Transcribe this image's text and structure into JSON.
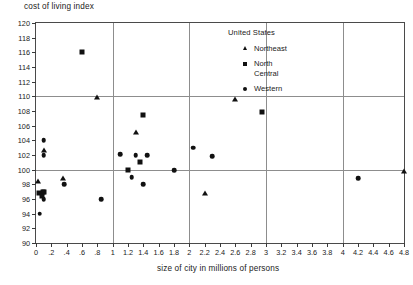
{
  "chart_data": {
    "type": "scatter",
    "title": "",
    "ylabel": "cost of living index",
    "xlabel": "size of city in millions of persons",
    "xlim": [
      0,
      4.8
    ],
    "ylim": [
      90,
      120
    ],
    "y_ticks": [
      90,
      92,
      94,
      96,
      98,
      100,
      102,
      104,
      106,
      108,
      110,
      112,
      114,
      116,
      118,
      120
    ],
    "x_ticks": [
      0,
      0.2,
      0.4,
      0.6,
      0.8,
      1.0,
      1.2,
      1.4,
      1.6,
      1.8,
      2.0,
      2.2,
      2.4,
      2.6,
      2.8,
      3.0,
      3.2,
      3.4,
      3.6,
      3.8,
      4.0,
      4.2,
      4.4,
      4.6,
      4.8
    ],
    "x_tick_labels": [
      "0",
      ".2",
      ".4",
      ".6",
      ".8",
      "1",
      "1.2",
      "1.4",
      "1.6",
      "1.8",
      "2",
      "2.2",
      "2.4",
      "2.6",
      "2.8",
      "3",
      "3.2",
      "3.4",
      "3.6",
      "3.8",
      "4",
      "4.2",
      "4.4",
      "4.6",
      "4.8"
    ],
    "gridlines_vertical": [
      1,
      2,
      3,
      4
    ],
    "gridlines_horizontal": [
      100,
      110
    ],
    "grid": true,
    "legend_position": "inside-top-right",
    "legend_title": "United States",
    "series": [
      {
        "name": "Northeast",
        "marker": "triangle",
        "color": "#111111",
        "points": [
          [
            0.02,
            98.6
          ],
          [
            0.1,
            102.8
          ],
          [
            0.35,
            99.0
          ],
          [
            0.8,
            110.0
          ],
          [
            1.3,
            105.3
          ],
          [
            2.2,
            97.0
          ],
          [
            2.6,
            109.8
          ],
          [
            4.8,
            100.0
          ]
        ]
      },
      {
        "name": "North\nCentral",
        "marker": "square",
        "color": "#111111",
        "points": [
          [
            0.04,
            96.8
          ],
          [
            0.09,
            96.9
          ],
          [
            0.11,
            97.0
          ],
          [
            0.08,
            96.4
          ],
          [
            0.6,
            116.0
          ],
          [
            1.2,
            100.0
          ],
          [
            1.35,
            101.0
          ],
          [
            1.4,
            107.5
          ],
          [
            2.95,
            107.8
          ]
        ]
      },
      {
        "name": "Western",
        "marker": "circle",
        "color": "#111111",
        "points": [
          [
            0.05,
            94.0
          ],
          [
            0.1,
            96.0
          ],
          [
            0.1,
            102.0
          ],
          [
            0.1,
            104.0
          ],
          [
            0.37,
            98.0
          ],
          [
            0.85,
            96.0
          ],
          [
            1.1,
            102.1
          ],
          [
            1.25,
            99.0
          ],
          [
            1.3,
            102.0
          ],
          [
            1.4,
            98.0
          ],
          [
            1.45,
            102.0
          ],
          [
            1.8,
            99.9
          ],
          [
            2.05,
            103.0
          ],
          [
            2.3,
            101.8
          ],
          [
            4.2,
            98.8
          ]
        ]
      }
    ]
  }
}
